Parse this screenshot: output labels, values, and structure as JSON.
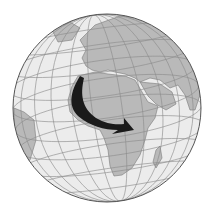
{
  "map": {
    "type": "orthographic-globe",
    "center_view": "Africa and Europe",
    "colors": {
      "background": "#ffffff",
      "ocean": "#ececec",
      "land": "#b9b9b9",
      "border": "#7a7a7a",
      "graticule": "#8c8c8c",
      "outline": "#555555",
      "arrow": "#1a1a1a"
    },
    "globe": {
      "cx": 107,
      "cy": 108,
      "r": 94
    },
    "arrow": {
      "description": "Curved black arrow from northwest Africa southward then eastward into central/east Africa",
      "start_region": "Northwest Africa",
      "end_region": "East Africa"
    }
  }
}
